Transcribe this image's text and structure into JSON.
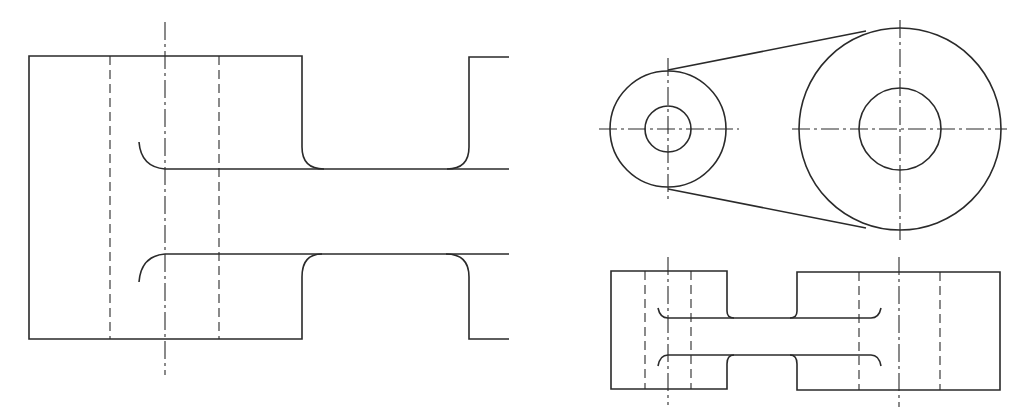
{
  "figure": {
    "type": "engineering-drawing",
    "colors": {
      "line": "#2a2a2a",
      "background": "#ffffff"
    },
    "views": [
      {
        "id": "enlarged-front-section",
        "description": "Enlarged elevation of connecting link end with fillets and hidden bore lines"
      },
      {
        "id": "top-view",
        "description": "Two pulleys/bosses (small and large) joined by tangent lines, each with concentric bore and center lines"
      },
      {
        "id": "front-view",
        "description": "Elevation of the link showing two bosses joined by web with fillets and hidden bore lines"
      }
    ]
  }
}
